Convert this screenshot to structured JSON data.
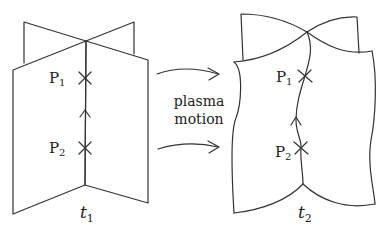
{
  "diagram": {
    "left_panel": {
      "time_label": "t",
      "time_sub": "1",
      "points": [
        {
          "name": "P",
          "sub": "1"
        },
        {
          "name": "P",
          "sub": "2"
        }
      ]
    },
    "right_panel": {
      "time_label": "t",
      "time_sub": "2",
      "points": [
        {
          "name": "P",
          "sub": "1"
        },
        {
          "name": "P",
          "sub": "2"
        }
      ]
    },
    "transition": {
      "line1": "plasma",
      "line2": "motion",
      "arrows": 2
    },
    "colors": {
      "stroke": "#333333",
      "text": "#222222",
      "background": "#ffffff"
    }
  }
}
